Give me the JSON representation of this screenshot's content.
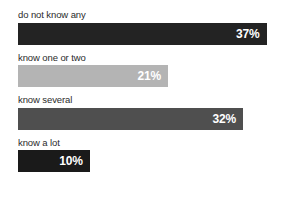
{
  "chart_data": {
    "type": "bar",
    "orientation": "horizontal",
    "title": "",
    "subtitle": "",
    "xlabel": "",
    "ylabel": "",
    "xlim": [
      0,
      40.8
    ],
    "grid": false,
    "legend": null,
    "value_suffix": "%",
    "categories": [
      "do not know any",
      "know one or two",
      "know several",
      "know a lot"
    ],
    "values": [
      37,
      21,
      32,
      10
    ],
    "value_labels": [
      "37%",
      "21%",
      "32%",
      "10%"
    ],
    "bar_colors": [
      "#232323",
      "#b4b4b4",
      "#4f4f4f",
      "#1a1a1a"
    ],
    "value_label_color": "#ffffff",
    "category_label_color": "#2b2b2b",
    "background_color": "#ffffff",
    "bars": [
      {
        "category": "do not know any",
        "value": 37,
        "value_label": "37%",
        "color": "#232323",
        "width_pct": "90.7%"
      },
      {
        "category": "know one or two",
        "value": 21,
        "value_label": "21%",
        "color": "#b4b4b4",
        "width_pct": "54.7%"
      },
      {
        "category": "know several",
        "value": 32,
        "value_label": "32%",
        "color": "#4f4f4f",
        "width_pct": "82.1%"
      },
      {
        "category": "know a lot",
        "value": 10,
        "value_label": "10%",
        "color": "#1a1a1a",
        "width_pct": "26.2%"
      }
    ]
  }
}
